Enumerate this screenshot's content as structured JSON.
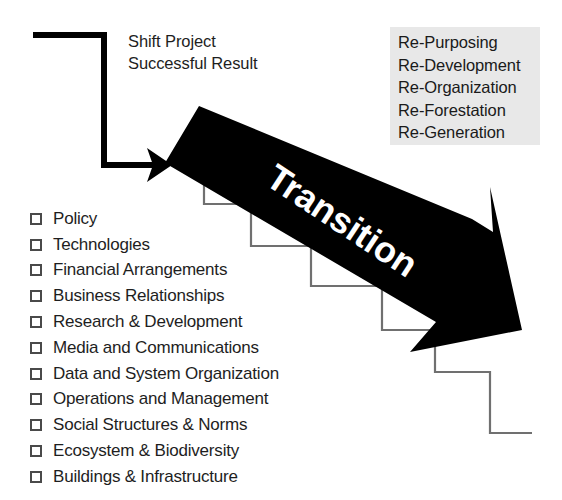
{
  "diagram": {
    "title_word": "Transition",
    "caption": {
      "line1": "Shift Project",
      "line2": "Successful Result"
    },
    "rewords": {
      "items": [
        "Re-Purposing",
        "Re-Development",
        "Re-Organization",
        "Re-Forestation",
        "Re-Generation"
      ],
      "background_color": "#e8e8e8"
    },
    "checklist": {
      "items": [
        "Policy",
        "Technologies",
        "Financial Arrangements",
        "Business Relationships",
        "Research & Development",
        "Media and Communications",
        "Data and System Organization",
        "Operations and Management",
        "Social Structures & Norms",
        "Ecosystem & Biodiversity",
        "Buildings & Infrastructure"
      ],
      "checked": [
        false,
        false,
        false,
        false,
        false,
        false,
        false,
        false,
        false,
        false,
        false
      ]
    },
    "colors": {
      "arrow_fill": "#000000",
      "stair_stroke": "#707070",
      "bracket_stroke": "#000000",
      "text": "#1e1e1e",
      "page_background": "#ffffff"
    }
  }
}
